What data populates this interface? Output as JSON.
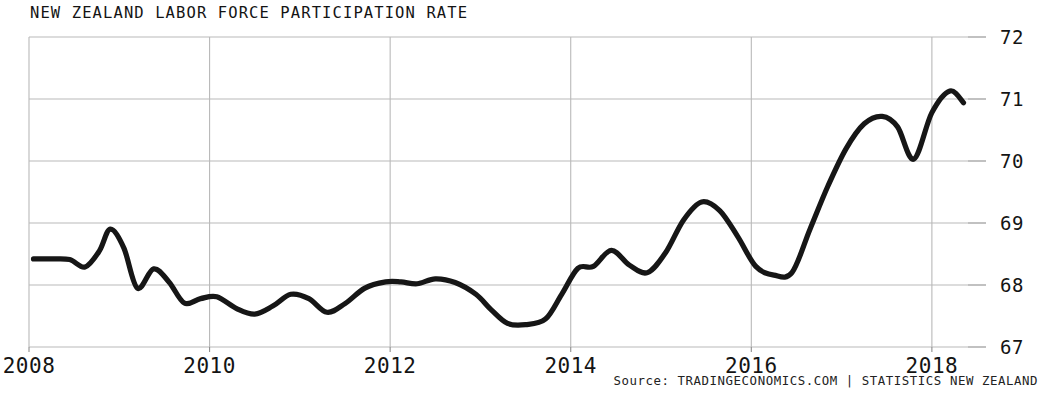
{
  "chart_data": {
    "type": "line",
    "title": "NEW ZEALAND LABOR FORCE PARTICIPATION RATE",
    "xlabel": "",
    "ylabel": "",
    "ylim": [
      67,
      72
    ],
    "xlim": [
      2008.0,
      2018.4
    ],
    "grid": true,
    "legend": null,
    "y_ticks": [
      67,
      68,
      69,
      70,
      71,
      72
    ],
    "y_tick_labels": [
      "67",
      "68",
      "69",
      "70",
      "71",
      "72"
    ],
    "x_ticks": [
      2008,
      2010,
      2012,
      2014,
      2016,
      2018
    ],
    "x_tick_labels": [
      "2008",
      "2010",
      "2012",
      "2014",
      "2016",
      "2018"
    ],
    "line_color": "#161616",
    "grid_color": "#b9b9b9",
    "series": [
      {
        "name": "Labor Force Participation Rate",
        "units": "percent",
        "x": [
          2008.05,
          2008.25,
          2008.45,
          2008.62,
          2008.78,
          2008.9,
          2009.05,
          2009.2,
          2009.38,
          2009.55,
          2009.72,
          2009.9,
          2010.08,
          2010.3,
          2010.5,
          2010.7,
          2010.9,
          2011.1,
          2011.3,
          2011.5,
          2011.72,
          2011.95,
          2012.12,
          2012.3,
          2012.5,
          2012.72,
          2012.95,
          2013.12,
          2013.3,
          2013.5,
          2013.72,
          2013.9,
          2014.08,
          2014.25,
          2014.45,
          2014.65,
          2014.85,
          2015.05,
          2015.25,
          2015.45,
          2015.65,
          2015.85,
          2016.05,
          2016.25,
          2016.45,
          2016.65,
          2016.85,
          2017.05,
          2017.25,
          2017.45,
          2017.62,
          2017.8,
          2018.0,
          2018.2,
          2018.35
        ],
        "values": [
          68.42,
          68.42,
          68.41,
          68.29,
          68.55,
          68.9,
          68.6,
          67.95,
          68.26,
          68.05,
          67.71,
          67.78,
          67.81,
          67.62,
          67.53,
          67.66,
          67.85,
          67.78,
          67.56,
          67.7,
          67.95,
          68.05,
          68.05,
          68.02,
          68.1,
          68.04,
          67.85,
          67.6,
          67.38,
          67.36,
          67.45,
          67.85,
          68.27,
          68.3,
          68.56,
          68.32,
          68.2,
          68.52,
          69.05,
          69.34,
          69.2,
          68.78,
          68.3,
          68.16,
          68.2,
          68.9,
          69.6,
          70.2,
          70.6,
          70.72,
          70.55,
          70.03,
          70.78,
          71.13,
          70.94
        ]
      }
    ],
    "source": {
      "prefix": "Source:",
      "attribution": "TRADINGECONOMICS.COM",
      "separator": "|",
      "provider": "STATISTICS NEW ZEALAND",
      "full": "Source: TRADINGECONOMICS.COM | STATISTICS NEW ZEALAND"
    }
  }
}
